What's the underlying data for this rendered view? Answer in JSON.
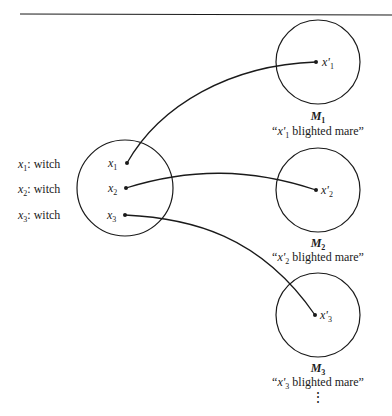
{
  "diagram": {
    "colors": {
      "stroke": "#1a1a1a",
      "background": "#ffffff"
    },
    "source_domain": {
      "assignments": [
        {
          "var": "x",
          "sub": "1",
          "sep": ":",
          "label": "witch"
        },
        {
          "var": "x",
          "sub": "2",
          "sep": ":",
          "label": "witch"
        },
        {
          "var": "x",
          "sub": "3",
          "sep": ":",
          "label": "witch"
        }
      ],
      "points": [
        {
          "var": "x",
          "sub": "1"
        },
        {
          "var": "x",
          "sub": "2"
        },
        {
          "var": "x",
          "sub": "3"
        }
      ]
    },
    "models": [
      {
        "name": "M",
        "sub": "1",
        "point_var": "x'",
        "point_sub": "1",
        "caption_open": "“",
        "caption_var": "x'",
        "caption_sub": "1",
        "caption_text": " blighted mare”"
      },
      {
        "name": "M",
        "sub": "2",
        "point_var": "x'",
        "point_sub": "2",
        "caption_open": "“",
        "caption_var": "x'",
        "caption_sub": "2",
        "caption_text": " blighted mare”"
      },
      {
        "name": "M",
        "sub": "3",
        "point_var": "x'",
        "point_sub": "3",
        "caption_open": "“",
        "caption_var": "x'",
        "caption_sub": "3",
        "caption_text": " blighted mare”"
      }
    ],
    "continuation": "⋮",
    "connections": [
      {
        "from": "x1",
        "to": "x'1"
      },
      {
        "from": "x2",
        "to": "x'2"
      },
      {
        "from": "x3",
        "to": "x'3"
      }
    ]
  }
}
